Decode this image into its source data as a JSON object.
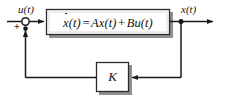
{
  "diagram": {
    "input_label": "u(t)",
    "output_label": "x(t)",
    "sum_sign": "+",
    "plant_equation": {
      "state_derivative": "x",
      "state_derivative_arg": "(t)",
      "equals": "=",
      "matrix_a": "A",
      "state": "x(t)",
      "plus": "+",
      "matrix_b": "B",
      "input": "u(t)",
      "full_text": "ẋ(t) = Ax(t) + Bu(t)"
    },
    "gain_block_label": "K",
    "colors": {
      "line": "#1a1a1a",
      "block_border": "#2b2b2b",
      "block_fill": "#ffffff",
      "shadow": "#9a9a9a",
      "background": "#ffffff",
      "text": "#111111"
    },
    "nodes": [
      {
        "name": "summing-junction",
        "shape": "circle",
        "cx": 25.5,
        "cy": 21.5,
        "r": 3.6
      },
      {
        "name": "output-branch-point",
        "shape": "dot",
        "cx": 181,
        "cy": 21.5,
        "r": 2.4
      },
      {
        "name": "feedback-entry-dot",
        "shape": "dot",
        "cx": 25.5,
        "cy": 27.5,
        "r": 2.4
      }
    ],
    "blocks": [
      {
        "name": "plant-block",
        "x": 46,
        "y": 9,
        "w": 124,
        "h": 26
      },
      {
        "name": "gain-block-k",
        "x": 96,
        "y": 62,
        "w": 33,
        "h": 30
      }
    ],
    "arrows": [
      {
        "name": "input-to-sum",
        "from": "u(t) label",
        "to": "summing junction"
      },
      {
        "name": "sum-to-plant",
        "from": "summing junction",
        "to": "plant block"
      },
      {
        "name": "plant-to-output",
        "from": "plant block",
        "to": "x(t) output"
      },
      {
        "name": "output-to-gain",
        "from": "output branch",
        "to": "gain block K"
      },
      {
        "name": "gain-to-sum",
        "from": "gain block K",
        "to": "summing junction"
      }
    ]
  }
}
